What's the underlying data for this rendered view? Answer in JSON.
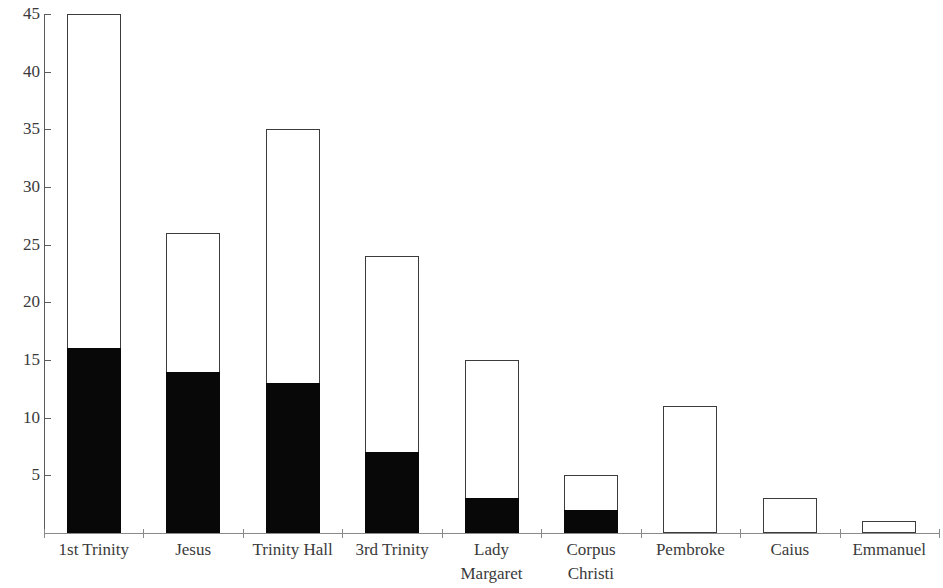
{
  "chart_data": {
    "type": "bar",
    "title": "",
    "subtitle": "",
    "xlabel": "",
    "ylabel": "",
    "ylim": [
      0,
      45
    ],
    "yticks": [
      5,
      10,
      15,
      20,
      25,
      30,
      35,
      40,
      45
    ],
    "ytick_labels": [
      "5",
      "10",
      "15",
      "20",
      "25",
      "30",
      "35",
      "40",
      "45"
    ],
    "grid": false,
    "legend": false,
    "legend_position": "none",
    "stacked": true,
    "categories": [
      "1st Trinity",
      "Jesus",
      "Trinity Hall",
      "3rd Trinity",
      "Lady Margaret",
      "Corpus Christi",
      "Pembroke",
      "Caius",
      "Emmanuel"
    ],
    "category_lines": [
      [
        "1st Trinity",
        ""
      ],
      [
        "Jesus",
        ""
      ],
      [
        "Trinity Hall",
        ""
      ],
      [
        "3rd Trinity",
        ""
      ],
      [
        "Lady",
        "Margaret"
      ],
      [
        "Corpus",
        "Christi"
      ],
      [
        "Pembroke",
        ""
      ],
      [
        "Caius",
        ""
      ],
      [
        "Emmanuel",
        ""
      ]
    ],
    "series": [
      {
        "name": "filled",
        "color": "#080808",
        "values": [
          16,
          14,
          13,
          7,
          3,
          2,
          0,
          0,
          0
        ]
      },
      {
        "name": "open",
        "color": "#ffffff",
        "values": [
          29,
          12,
          22,
          17,
          12,
          3,
          11,
          3,
          1
        ]
      }
    ],
    "totals": [
      45,
      26,
      35,
      24,
      15,
      5,
      11,
      3,
      1
    ],
    "colors": {
      "bar_outline": "#3c3c3c",
      "bar_fill_dark": "#080808",
      "bar_fill_light": "#ffffff",
      "axis": "#7a7a7a",
      "text": "#3a3a3a",
      "background": "#ffffff"
    }
  }
}
